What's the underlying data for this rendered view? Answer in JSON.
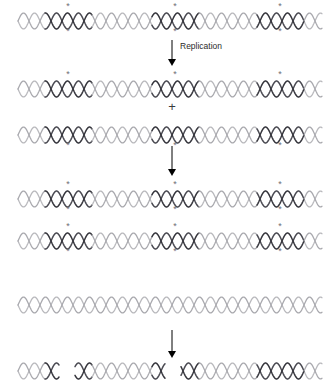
{
  "figure": {
    "background": "#ffffff",
    "width": 336,
    "height": 383
  },
  "colors": {
    "strand_light": "#b9b9bd",
    "strand_light_alt": "#a9a9ae",
    "strand_dark": "#4a4a52",
    "strand_dark_alt": "#35353c",
    "marker": "#6e6e73",
    "arrow": "#000000",
    "text": "#2b2b2b"
  },
  "labels": {
    "replication": "Replication",
    "plus": "+"
  },
  "icons": {
    "arrow": "down-arrow-icon",
    "marker": "asterisk-marker-icon",
    "helix": "dna-double-helix-icon"
  },
  "geometry": {
    "helix_amplitude": 8,
    "helix_period": 22,
    "helix_left": 18,
    "helix_right": 322,
    "label_positions": [
      68,
      175,
      280
    ],
    "label_segment_halfwidth": 23
  },
  "stages": [
    {
      "id": "stage-1-parent-duplex",
      "name": "parent-labeled-duplex",
      "y": 8,
      "rows": [
        {
          "id": "row-parent",
          "markers_top": [
            68,
            175,
            280
          ],
          "markers_bottom": [
            68,
            175,
            280
          ],
          "dark_segments": [
            68,
            175,
            280
          ],
          "fragmented": false
        }
      ]
    },
    {
      "id": "stage-2-first-generation",
      "name": "first-generation-daughters",
      "y": 76,
      "rows": [
        {
          "id": "row-daughter-a",
          "markers_top": [
            68,
            175,
            280
          ],
          "markers_bottom": [],
          "dark_segments": [
            68,
            175,
            280
          ],
          "fragmented": false
        },
        {
          "id": "row-daughter-b",
          "markers_top": [],
          "markers_bottom": [
            68,
            175,
            280
          ],
          "dark_segments": [
            68,
            175,
            280
          ],
          "fragmented": false
        }
      ]
    },
    {
      "id": "stage-3-second-generation",
      "name": "second-generation-duplexes",
      "y": 186,
      "rows": [
        {
          "id": "row-second-a",
          "markers_top": [
            68,
            175,
            280
          ],
          "markers_bottom": [
            68,
            175,
            280
          ],
          "dark_segments": [
            68,
            175,
            280
          ],
          "fragmented": false
        },
        {
          "id": "row-second-b",
          "markers_top": [
            68,
            175,
            280
          ],
          "markers_bottom": [
            68,
            175,
            280
          ],
          "dark_segments": [
            68,
            175,
            280
          ],
          "fragmented": false
        }
      ]
    },
    {
      "id": "stage-4-unlabeled-duplex",
      "name": "unlabeled-duplex",
      "y": 292,
      "rows": [
        {
          "id": "row-unlabeled",
          "markers_top": [],
          "markers_bottom": [],
          "dark_segments": [],
          "fragmented": false
        }
      ]
    },
    {
      "id": "stage-5-fragmented-duplex",
      "name": "fragmented-duplex",
      "y": 358,
      "rows": [
        {
          "id": "row-fragmented",
          "markers_top": [],
          "markers_bottom": [],
          "dark_segments": [
            68,
            175,
            280
          ],
          "fragmented": true,
          "gaps": [
            [
              60,
              74
            ],
            [
              166,
              180
            ]
          ]
        }
      ]
    }
  ],
  "arrows": [
    {
      "id": "arrow-replication",
      "x": 172,
      "y": 40,
      "height": 26,
      "label": "Replication",
      "label_x": 180,
      "label_y": 41
    },
    {
      "id": "arrow-second-round",
      "x": 172,
      "y": 146,
      "height": 30,
      "label": "",
      "label_x": 0,
      "label_y": 0
    },
    {
      "id": "arrow-fragmentation",
      "x": 172,
      "y": 330,
      "height": 28,
      "label": "",
      "label_x": 0,
      "label_y": 0
    }
  ]
}
